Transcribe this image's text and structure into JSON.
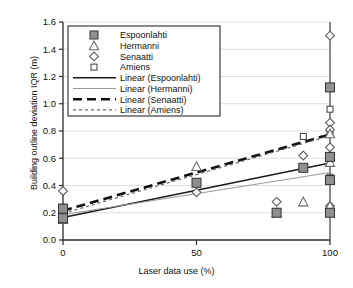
{
  "chart_data": {
    "type": "scatter",
    "title": "",
    "xlabel": "Laser data use (%)",
    "ylabel": "Building outline deviation IQR (m)",
    "xlim": [
      0,
      100
    ],
    "ylim": [
      0.0,
      1.6
    ],
    "xticks": [
      "0",
      "50",
      "100"
    ],
    "xtick_values": [
      0,
      50,
      100
    ],
    "yticks": [
      "0.0",
      "0.2",
      "0.4",
      "0.6",
      "0.8",
      "1.0",
      "1.2",
      "1.4",
      "1.6"
    ],
    "ytick_values": [
      0.0,
      0.2,
      0.4,
      0.6,
      0.8,
      1.0,
      1.2,
      1.4,
      1.6
    ],
    "grid": true,
    "legend_position": "top-left",
    "series": [
      {
        "name": "Espoonlahti",
        "marker": "filled-square",
        "color": "#888888",
        "points": [
          {
            "x": 0,
            "y": 0.23
          },
          {
            "x": 0,
            "y": 0.16
          },
          {
            "x": 50,
            "y": 0.42
          },
          {
            "x": 80,
            "y": 0.2
          },
          {
            "x": 90,
            "y": 0.53
          },
          {
            "x": 100,
            "y": 1.12
          },
          {
            "x": 100,
            "y": 0.61
          },
          {
            "x": 100,
            "y": 0.44
          },
          {
            "x": 100,
            "y": 0.2
          }
        ]
      },
      {
        "name": "Hermanni",
        "marker": "open-triangle",
        "color": "#8a8a8a",
        "points": [
          {
            "x": 0,
            "y": 0.15
          },
          {
            "x": 50,
            "y": 0.54
          },
          {
            "x": 80,
            "y": 0.2
          },
          {
            "x": 90,
            "y": 0.28
          },
          {
            "x": 100,
            "y": 0.78
          },
          {
            "x": 100,
            "y": 0.57
          },
          {
            "x": 100,
            "y": 0.45
          },
          {
            "x": 100,
            "y": 0.25
          }
        ]
      },
      {
        "name": "Senaatti",
        "marker": "open-diamond",
        "color": "#6f6f6f",
        "points": [
          {
            "x": 0,
            "y": 0.36
          },
          {
            "x": 0,
            "y": 0.22
          },
          {
            "x": 50,
            "y": 0.35
          },
          {
            "x": 80,
            "y": 0.28
          },
          {
            "x": 90,
            "y": 0.62
          },
          {
            "x": 100,
            "y": 1.5
          },
          {
            "x": 100,
            "y": 0.86
          },
          {
            "x": 100,
            "y": 0.81
          },
          {
            "x": 100,
            "y": 0.68
          },
          {
            "x": 100,
            "y": 0.25
          }
        ]
      },
      {
        "name": "Amiens",
        "marker": "open-square",
        "color": "#4a4a4a",
        "points": [
          {
            "x": 0,
            "y": 0.24
          },
          {
            "x": 0,
            "y": 0.18
          },
          {
            "x": 90,
            "y": 0.76
          },
          {
            "x": 100,
            "y": 0.96
          },
          {
            "x": 100,
            "y": 0.79
          },
          {
            "x": 100,
            "y": 0.46
          }
        ]
      }
    ],
    "trendlines": [
      {
        "name": "Linear (Espoonlahti)",
        "style": "solid",
        "color": "#1a1a1a",
        "width": 1.4,
        "x0": 0,
        "y0": 0.165,
        "x1": 100,
        "y1": 0.565
      },
      {
        "name": "Linear (Hermanni)",
        "style": "thin-solid",
        "color": "#9a9a9a",
        "width": 1.1,
        "x0": 0,
        "y0": 0.185,
        "x1": 100,
        "y1": 0.495
      },
      {
        "name": "Linear (Senaatti)",
        "style": "thick-dashed",
        "color": "#111111",
        "width": 2.6,
        "x0": 0,
        "y0": 0.215,
        "x1": 100,
        "y1": 0.775
      },
      {
        "name": "Linear (Amiens)",
        "style": "dotted",
        "color": "#6a6a6a",
        "width": 1.2,
        "x0": 0,
        "y0": 0.195,
        "x1": 100,
        "y1": 0.765
      }
    ]
  },
  "legend": {
    "items": [
      {
        "label": "Espoonlahti",
        "kind": "marker",
        "marker": "filled-square"
      },
      {
        "label": "Hermanni",
        "kind": "marker",
        "marker": "open-triangle"
      },
      {
        "label": "Senaatti",
        "kind": "marker",
        "marker": "open-diamond"
      },
      {
        "label": "Amiens",
        "kind": "marker",
        "marker": "open-square"
      },
      {
        "label": "Linear (Espoonlahti)",
        "kind": "line",
        "style": "solid"
      },
      {
        "label": "Linear (Hermanni)",
        "kind": "line",
        "style": "thin-solid"
      },
      {
        "label": "Linear (Senaatti)",
        "kind": "line",
        "style": "thick-dashed"
      },
      {
        "label": "Linear (Amiens)",
        "kind": "line",
        "style": "dotted"
      }
    ]
  },
  "colors": {
    "axis": "#2b2b2b",
    "grid": "#d8d8d8",
    "background": "#ffffff",
    "marker_fill": "#8f8f8f"
  }
}
